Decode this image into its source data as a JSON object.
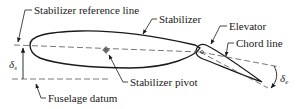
{
  "diagram": {
    "labels": {
      "stabilizer_reference_line": "Stabilizer reference line",
      "stabilizer": "Stabilizer",
      "elevator": "Elevator",
      "chord_line": "Chord line",
      "stabilizer_pivot": "Stabilizer pivot",
      "fuselage_datum": "Fuselage datum"
    },
    "symbols": {
      "delta_s": "δ",
      "delta_s_sub": "s",
      "delta_e": "δ",
      "delta_e_sub": "e"
    },
    "colors": {
      "line": "#1a1a1a",
      "dashed": "#555555"
    }
  }
}
